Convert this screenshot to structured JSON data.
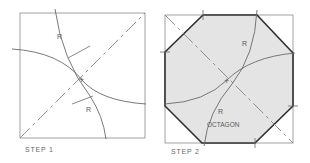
{
  "figure": {
    "panels": [
      {
        "caption": "STEP 1",
        "square": {
          "x": 20,
          "y": 13,
          "size": 125
        },
        "labels": [
          {
            "text": "R",
            "x": 57,
            "y": 39
          },
          {
            "text": "R",
            "x": 86,
            "y": 112
          }
        ],
        "center_mark": "+"
      },
      {
        "caption": "STEP 2",
        "square": {
          "x": 165,
          "y": 15,
          "size": 128
        },
        "labels": [
          {
            "text": "R",
            "x": 242,
            "y": 46
          },
          {
            "text": "R",
            "x": 218,
            "y": 114
          },
          {
            "text": "OCTAGON",
            "x": 207,
            "y": 127
          }
        ],
        "center_mark": "+",
        "shape": "octagon"
      }
    ],
    "colors": {
      "line": "#7a7a7a",
      "outline": "#2e2e2e",
      "fill": "#e4e4e4"
    }
  }
}
